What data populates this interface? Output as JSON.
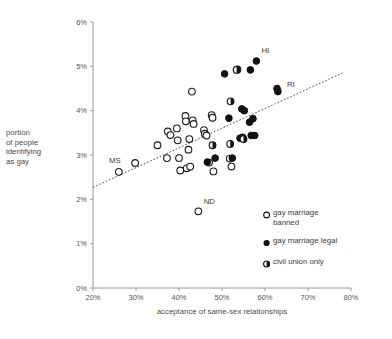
{
  "chart_data": {
    "type": "scatter",
    "title": "",
    "xlabel": "acceptance of same-sex relationships",
    "ylabel": "portion of people identifying as gay",
    "xlim": [
      20,
      80
    ],
    "ylim": [
      0,
      6
    ],
    "xticks": [
      "20%",
      "30%",
      "40%",
      "50%",
      "60%",
      "70%",
      "80%"
    ],
    "yticks": [
      "0%",
      "1%",
      "2%",
      "3%",
      "4%",
      "5%",
      "6%"
    ],
    "grid": false,
    "legend_position": "bottom-right",
    "series": [
      {
        "name": "gay marriage banned",
        "marker": "open-circle",
        "points": [
          {
            "x": 26.0,
            "y": 2.62,
            "label": "MS"
          },
          {
            "x": 29.8,
            "y": 2.82,
            "label": ""
          },
          {
            "x": 35.0,
            "y": 3.22,
            "label": ""
          },
          {
            "x": 37.2,
            "y": 2.93,
            "label": ""
          },
          {
            "x": 37.4,
            "y": 3.53,
            "label": ""
          },
          {
            "x": 38.0,
            "y": 3.45,
            "label": ""
          },
          {
            "x": 39.5,
            "y": 3.6,
            "label": ""
          },
          {
            "x": 39.7,
            "y": 3.33,
            "label": ""
          },
          {
            "x": 40.0,
            "y": 2.93,
            "label": ""
          },
          {
            "x": 40.3,
            "y": 2.65,
            "label": ""
          },
          {
            "x": 41.5,
            "y": 3.88,
            "label": ""
          },
          {
            "x": 41.6,
            "y": 3.76,
            "label": ""
          },
          {
            "x": 41.8,
            "y": 2.7,
            "label": ""
          },
          {
            "x": 42.2,
            "y": 3.12,
            "label": ""
          },
          {
            "x": 42.4,
            "y": 3.36,
            "label": ""
          },
          {
            "x": 42.6,
            "y": 2.74,
            "label": ""
          },
          {
            "x": 43.0,
            "y": 4.43,
            "label": ""
          },
          {
            "x": 43.2,
            "y": 3.78,
            "label": ""
          },
          {
            "x": 43.4,
            "y": 3.7,
            "label": ""
          },
          {
            "x": 44.5,
            "y": 1.73,
            "label": "ND"
          },
          {
            "x": 45.8,
            "y": 3.56,
            "label": ""
          },
          {
            "x": 46.0,
            "y": 3.48,
            "label": ""
          },
          {
            "x": 46.4,
            "y": 3.44,
            "label": ""
          },
          {
            "x": 47.0,
            "y": 2.83,
            "label": ""
          },
          {
            "x": 47.6,
            "y": 3.9,
            "label": ""
          },
          {
            "x": 47.8,
            "y": 3.84,
            "label": ""
          },
          {
            "x": 48.0,
            "y": 2.63,
            "label": ""
          },
          {
            "x": 51.8,
            "y": 2.92,
            "label": ""
          },
          {
            "x": 52.2,
            "y": 2.74,
            "label": ""
          },
          {
            "x": 53.6,
            "y": 4.93,
            "label": ""
          }
        ]
      },
      {
        "name": "gay marriage legal",
        "marker": "filled-circle",
        "points": [
          {
            "x": 46.6,
            "y": 2.84,
            "label": ""
          },
          {
            "x": 48.4,
            "y": 2.93,
            "label": ""
          },
          {
            "x": 50.6,
            "y": 4.83,
            "label": ""
          },
          {
            "x": 51.6,
            "y": 3.83,
            "label": ""
          },
          {
            "x": 52.4,
            "y": 2.93,
            "label": ""
          },
          {
            "x": 54.2,
            "y": 3.38,
            "label": ""
          },
          {
            "x": 54.6,
            "y": 4.04,
            "label": ""
          },
          {
            "x": 54.8,
            "y": 3.4,
            "label": ""
          },
          {
            "x": 55.2,
            "y": 4.0,
            "label": ""
          },
          {
            "x": 56.4,
            "y": 3.74,
            "label": ""
          },
          {
            "x": 56.6,
            "y": 4.92,
            "label": ""
          },
          {
            "x": 56.8,
            "y": 3.44,
            "label": ""
          },
          {
            "x": 57.2,
            "y": 3.82,
            "label": ""
          },
          {
            "x": 57.6,
            "y": 3.44,
            "label": ""
          },
          {
            "x": 58.0,
            "y": 5.12,
            "label": "HI"
          },
          {
            "x": 62.8,
            "y": 4.5,
            "label": ""
          },
          {
            "x": 63.0,
            "y": 4.43,
            "label": "RI"
          }
        ]
      },
      {
        "name": "civil union only",
        "marker": "half-filled-circle",
        "points": [
          {
            "x": 47.8,
            "y": 3.22,
            "label": ""
          },
          {
            "x": 51.9,
            "y": 3.25,
            "label": ""
          },
          {
            "x": 52.0,
            "y": 4.21,
            "label": ""
          },
          {
            "x": 53.4,
            "y": 4.92,
            "label": ""
          },
          {
            "x": 55.0,
            "y": 3.36,
            "label": ""
          }
        ]
      }
    ],
    "trendline": {
      "x0": 20,
      "y0": 2.27,
      "x1": 78,
      "y1": 4.85,
      "style": "dotted"
    },
    "annotations": [
      {
        "text": "MS",
        "x": 26.0,
        "y": 2.62
      },
      {
        "text": "ND",
        "x": 44.5,
        "y": 1.73
      },
      {
        "text": "HI",
        "x": 58.0,
        "y": 5.12
      },
      {
        "text": "RI",
        "x": 63.0,
        "y": 4.43
      }
    ]
  },
  "axis": {
    "x_title": "acceptance of same-sex relationships",
    "y_title_lines": [
      "portion",
      "of people",
      "identifying",
      "as gay"
    ]
  },
  "legend": {
    "items": [
      {
        "label_line1": "gay marriage",
        "label_line2": "banned",
        "marker": "open-circle"
      },
      {
        "label_line1": "gay marriage legal",
        "label_line2": "",
        "marker": "filled-circle"
      },
      {
        "label_line1": "civil union only",
        "label_line2": "",
        "marker": "half-filled-circle"
      }
    ]
  },
  "colors": {
    "marker_stroke": "#111111",
    "marker_fill": "#111111",
    "axis": "#9a9a9a",
    "text": "#3a3a3a",
    "background": "#ffffff"
  }
}
